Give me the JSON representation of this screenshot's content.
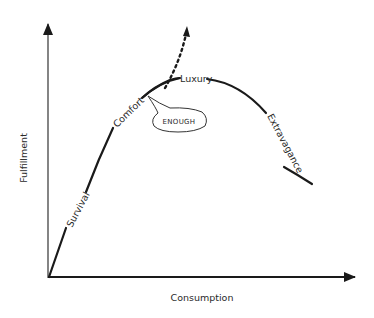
{
  "diagram": {
    "title": "",
    "axes": {
      "x_label": "Consumption",
      "y_label": "Fulfillment"
    },
    "curve_stages": [
      {
        "id": "survival",
        "label": "Survival"
      },
      {
        "id": "comfort",
        "label": "Comfort"
      },
      {
        "id": "luxury",
        "label": "Luxury"
      },
      {
        "id": "extravagance",
        "label": "Extravagance"
      }
    ],
    "callout": {
      "label": "ENOUGH"
    },
    "colors": {
      "line": "#1a1a1a",
      "text": "#2a2a2a",
      "background": "#ffffff"
    }
  }
}
